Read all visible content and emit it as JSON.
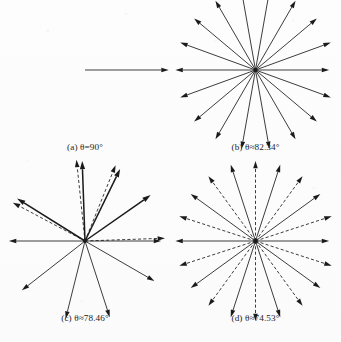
{
  "figure": {
    "background_color": "#fbfbfb",
    "ink_color": "#1a1a1a",
    "panel_count": 4
  },
  "chart_data": {
    "type": "scatter",
    "title": "",
    "subtitle": "",
    "xlabel": "",
    "ylabel": "",
    "legend": [
      {
        "name": "solid vector",
        "style": "solid"
      },
      {
        "name": "dashed vector",
        "style": "dashed"
      }
    ],
    "panels": [
      {
        "id": "a",
        "label": "(a)",
        "theta_relation": "=",
        "theta_value": "90",
        "theta_unit": "°",
        "caption": "(a) θ=90°",
        "vector_count": 1,
        "solid_count": 1,
        "dashed_count": 0,
        "center": [
          0.5,
          0.5
        ],
        "radius": 0.46,
        "vectors": [
          {
            "angle_deg": 0,
            "style": "solid",
            "length": 1.0
          }
        ]
      },
      {
        "id": "b",
        "label": "(b)",
        "theta_relation": "≈",
        "theta_value": "82.34",
        "theta_unit": "°",
        "caption": "(b) θ≈82.34°",
        "vector_count": 18,
        "solid_count": 18,
        "dashed_count": 0,
        "center": [
          0.5,
          0.5
        ],
        "radius": 0.44,
        "vectors": [
          {
            "angle_deg": 0,
            "style": "solid",
            "length": 0.92
          },
          {
            "angle_deg": 20,
            "style": "solid",
            "length": 1.0
          },
          {
            "angle_deg": 40,
            "style": "solid",
            "length": 1.0
          },
          {
            "angle_deg": 60,
            "style": "solid",
            "length": 1.0
          },
          {
            "angle_deg": 80,
            "style": "solid",
            "length": 1.0
          },
          {
            "angle_deg": 100,
            "style": "solid",
            "length": 1.0
          },
          {
            "angle_deg": 120,
            "style": "solid",
            "length": 1.0
          },
          {
            "angle_deg": 140,
            "style": "solid",
            "length": 1.0
          },
          {
            "angle_deg": 160,
            "style": "solid",
            "length": 1.0
          },
          {
            "angle_deg": 180,
            "style": "solid",
            "length": 1.0
          },
          {
            "angle_deg": 200,
            "style": "solid",
            "length": 1.0
          },
          {
            "angle_deg": 220,
            "style": "solid",
            "length": 1.0
          },
          {
            "angle_deg": 240,
            "style": "solid",
            "length": 1.0
          },
          {
            "angle_deg": 260,
            "style": "solid",
            "length": 1.0
          },
          {
            "angle_deg": 280,
            "style": "solid",
            "length": 1.0
          },
          {
            "angle_deg": 300,
            "style": "solid",
            "length": 1.0
          },
          {
            "angle_deg": 320,
            "style": "solid",
            "length": 1.0
          },
          {
            "angle_deg": 340,
            "style": "solid",
            "length": 1.0
          }
        ]
      },
      {
        "id": "c",
        "label": "(c)",
        "theta_relation": "≈",
        "theta_value": "78.46",
        "theta_unit": "°",
        "caption": "(c) θ≈78.46°",
        "vector_count": 13,
        "solid_count": 9,
        "dashed_count": 4,
        "center": [
          0.5,
          0.5
        ],
        "radius": 0.44,
        "vectors": [
          {
            "angle_deg": 0,
            "style": "solid",
            "length": 0.95
          },
          {
            "angle_deg": 2,
            "style": "dashed",
            "length": 1.0
          },
          {
            "angle_deg": 35,
            "style": "solid",
            "length": 1.0,
            "weight": "heavy"
          },
          {
            "angle_deg": 64,
            "style": "solid",
            "length": 1.0,
            "weight": "heavy"
          },
          {
            "angle_deg": 68,
            "style": "dashed",
            "length": 1.02
          },
          {
            "angle_deg": 92,
            "style": "solid",
            "length": 1.0,
            "weight": "heavy"
          },
          {
            "angle_deg": 96,
            "style": "dashed",
            "length": 1.02
          },
          {
            "angle_deg": 148,
            "style": "solid",
            "length": 1.0,
            "weight": "heavy"
          },
          {
            "angle_deg": 152,
            "style": "dashed",
            "length": 1.02
          },
          {
            "angle_deg": 180,
            "style": "solid",
            "length": 0.95
          },
          {
            "angle_deg": 218,
            "style": "solid",
            "length": 1.0
          },
          {
            "angle_deg": 256,
            "style": "solid",
            "length": 1.0
          },
          {
            "angle_deg": 288,
            "style": "solid",
            "length": 1.0
          },
          {
            "angle_deg": 330,
            "style": "solid",
            "length": 1.0
          }
        ]
      },
      {
        "id": "d",
        "label": "(d)",
        "theta_relation": "≈",
        "theta_value": "74.53",
        "theta_unit": "°",
        "caption": "(d) θ≈74.53°",
        "vector_count": 20,
        "solid_count": 10,
        "dashed_count": 10,
        "center": [
          0.5,
          0.5
        ],
        "radius": 0.44,
        "vectors": [
          {
            "angle_deg": 0,
            "style": "solid",
            "length": 0.92
          },
          {
            "angle_deg": 18,
            "style": "dashed",
            "length": 1.0
          },
          {
            "angle_deg": 36,
            "style": "solid",
            "length": 1.0
          },
          {
            "angle_deg": 54,
            "style": "dashed",
            "length": 1.0
          },
          {
            "angle_deg": 72,
            "style": "solid",
            "length": 1.0
          },
          {
            "angle_deg": 90,
            "style": "dashed",
            "length": 1.0
          },
          {
            "angle_deg": 108,
            "style": "solid",
            "length": 1.0
          },
          {
            "angle_deg": 126,
            "style": "dashed",
            "length": 1.0
          },
          {
            "angle_deg": 144,
            "style": "solid",
            "length": 1.0
          },
          {
            "angle_deg": 162,
            "style": "dashed",
            "length": 1.0
          },
          {
            "angle_deg": 180,
            "style": "solid",
            "length": 1.0
          },
          {
            "angle_deg": 198,
            "style": "dashed",
            "length": 1.0
          },
          {
            "angle_deg": 216,
            "style": "solid",
            "length": 1.0
          },
          {
            "angle_deg": 234,
            "style": "dashed",
            "length": 1.0
          },
          {
            "angle_deg": 252,
            "style": "solid",
            "length": 1.0
          },
          {
            "angle_deg": 270,
            "style": "dashed",
            "length": 1.0
          },
          {
            "angle_deg": 288,
            "style": "solid",
            "length": 1.0
          },
          {
            "angle_deg": 306,
            "style": "dashed",
            "length": 1.0
          },
          {
            "angle_deg": 324,
            "style": "solid",
            "length": 1.0
          },
          {
            "angle_deg": 342,
            "style": "dashed",
            "length": 1.0
          }
        ]
      }
    ]
  }
}
